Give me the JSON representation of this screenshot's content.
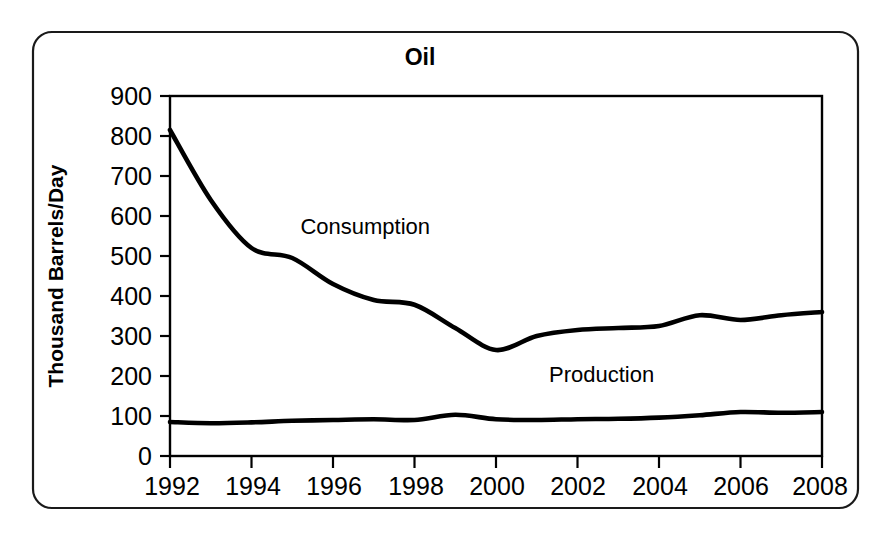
{
  "figure": {
    "title": "Oil",
    "border_color": "#1a1a1a",
    "background": "#ffffff"
  },
  "chart_data": {
    "type": "line",
    "title": "Oil",
    "xlabel": "",
    "ylabel": "Thousand Barrels/Day",
    "xlim": [
      1992,
      2008
    ],
    "ylim": [
      0,
      900
    ],
    "grid": false,
    "legend": "inline-annotations",
    "xticks": [
      "1992",
      "1994",
      "1996",
      "1998",
      "2000",
      "2002",
      "2004",
      "2006",
      "2008"
    ],
    "xtick_values": [
      1992,
      1994,
      1996,
      1998,
      2000,
      2002,
      2004,
      2006,
      2008
    ],
    "yticks": [
      "0",
      "100",
      "200",
      "300",
      "400",
      "500",
      "600",
      "700",
      "800",
      "900"
    ],
    "ytick_values": [
      0,
      100,
      200,
      300,
      400,
      500,
      600,
      700,
      800,
      900
    ],
    "x": [
      1992,
      1993,
      1994,
      1995,
      1996,
      1997,
      1998,
      1999,
      2000,
      2001,
      2002,
      2003,
      2004,
      2005,
      2006,
      2007,
      2008
    ],
    "series": [
      {
        "name": "Consumption",
        "color": "#000000",
        "values": [
          815,
          640,
          520,
          495,
          430,
          390,
          378,
          320,
          265,
          300,
          315,
          320,
          325,
          352,
          340,
          352,
          360
        ]
      },
      {
        "name": "Production",
        "color": "#000000",
        "values": [
          85,
          82,
          84,
          88,
          90,
          92,
          90,
          103,
          92,
          90,
          92,
          93,
          96,
          102,
          110,
          108,
          110
        ]
      }
    ],
    "annotations": [
      {
        "text": "Consumption",
        "x": 1995.2,
        "y": 555
      },
      {
        "text": "Production",
        "x": 2001.3,
        "y": 185
      }
    ]
  }
}
